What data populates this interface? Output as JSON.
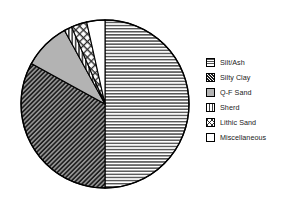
{
  "chart_data": {
    "type": "pie",
    "title": "",
    "subtitle": "",
    "xlabel": "",
    "ylabel": "",
    "legend_position": "right",
    "grid": false,
    "start_angle_deg": 0,
    "direction": "clockwise",
    "categories": [
      "Silt/Ash",
      "Silty Clay",
      "Q-F Sand",
      "Sherd",
      "Lithic Sand",
      "Miscellaneous"
    ],
    "values": [
      50.0,
      33.0,
      9.0,
      1.5,
      3.0,
      3.5
    ],
    "slices": [
      {
        "label": "Silt/Ash",
        "value": 50.0,
        "start_angle_deg": 0,
        "end_angle_deg": 180,
        "pattern": "horizontal-lines",
        "fill": "#ffffff",
        "stroke": "#000000"
      },
      {
        "label": "Silty Clay",
        "value": 33.0,
        "start_angle_deg": 180,
        "end_angle_deg": 298.8,
        "pattern": "dense-diagonal-hatch",
        "fill": "#2b2b2b",
        "stroke": "#000000"
      },
      {
        "label": "Q-F Sand",
        "value": 9.0,
        "start_angle_deg": 298.8,
        "end_angle_deg": 331.2,
        "pattern": "solid-light-gray",
        "fill": "#b3b3b3",
        "stroke": "#000000"
      },
      {
        "label": "Sherd",
        "value": 1.5,
        "start_angle_deg": 331.2,
        "end_angle_deg": 336.6,
        "pattern": "vertical-lines",
        "fill": "#ffffff",
        "stroke": "#000000"
      },
      {
        "label": "Lithic Sand",
        "value": 3.0,
        "start_angle_deg": 336.6,
        "end_angle_deg": 347.4,
        "pattern": "sparse-diagonal-dots",
        "fill": "#ffffff",
        "stroke": "#000000"
      },
      {
        "label": "Miscellaneous",
        "value": 3.5,
        "start_angle_deg": 347.4,
        "end_angle_deg": 360,
        "pattern": "blank-white",
        "fill": "#ffffff",
        "stroke": "#000000"
      }
    ],
    "geometry": {
      "center_x": 105,
      "center_y": 104,
      "radius": 84
    }
  },
  "legend": {
    "items": [
      {
        "label": "Silt/Ash",
        "pattern": "horizontal-lines"
      },
      {
        "label": "Silty Clay",
        "pattern": "dense-diagonal-hatch"
      },
      {
        "label": "Q-F Sand",
        "pattern": "solid-light-gray"
      },
      {
        "label": "Sherd",
        "pattern": "vertical-lines"
      },
      {
        "label": "Lithic Sand",
        "pattern": "sparse-diagonal-dots"
      },
      {
        "label": "Miscellaneous",
        "pattern": "blank-white"
      }
    ]
  },
  "colors": {
    "outline": "#000000",
    "background": "#ffffff",
    "gray_fill": "#b3b3b3",
    "dark_fill": "#2b2b2b",
    "text": "#1a1a1a"
  }
}
